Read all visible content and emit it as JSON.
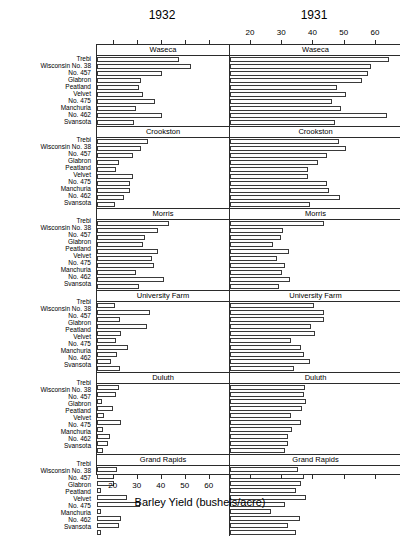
{
  "titles": {
    "left_year": "1932",
    "right_year": "1931",
    "xlabel": "Barley Yield (bushels/acre)"
  },
  "axis": {
    "ticks": [
      20,
      30,
      40,
      50,
      60
    ],
    "tick_labels": [
      "20",
      "30",
      "40",
      "50",
      "60"
    ],
    "min": 13,
    "max": 68,
    "left_labels_shown": false,
    "right_labels_shown": true,
    "bottom_labels_shown": true
  },
  "varieties": [
    "Trebi",
    "Wisconsin No. 38",
    "No. 457",
    "Glabron",
    "Peatland",
    "Velvet",
    "No. 475",
    "Manchuria",
    "No. 462",
    "Svansota"
  ],
  "sites": [
    "Waseca",
    "Crookston",
    "Morris",
    "University Farm",
    "Duluth",
    "Grand Rapids"
  ],
  "chart_data": {
    "type": "bar",
    "xlabel": "Barley Yield (bushels/acre)",
    "ylabel": "",
    "xlim": [
      13,
      68
    ],
    "grid": false,
    "orientation": "horizontal",
    "categories": [
      "Trebi",
      "Wisconsin No. 38",
      "No. 457",
      "Glabron",
      "Peatland",
      "Velvet",
      "No. 475",
      "Manchuria",
      "No. 462",
      "Svansota"
    ],
    "facet_rows": [
      "Waseca",
      "Crookston",
      "Morris",
      "University Farm",
      "Duluth",
      "Grand Rapids"
    ],
    "facet_columns": [
      "1932",
      "1931"
    ],
    "series": [
      {
        "name": "1932",
        "panels": [
          {
            "site": "Waseca",
            "values": [
              47.3,
              52.2,
              39.9,
              31.4,
              30.6,
              32.1,
              37.2,
              29.4,
              40.0,
              28.6
            ]
          },
          {
            "site": "Crookston",
            "values": [
              34.4,
              31.3,
              28.1,
              22.1,
              21.1,
              28.0,
              26.8,
              26.9,
              24.3,
              20.6
            ]
          },
          {
            "site": "Morris",
            "values": [
              42.8,
              38.3,
              33.1,
              32.1,
              38.4,
              35.8,
              36.7,
              29.3,
              41.0,
              30.6
            ]
          },
          {
            "site": "University Farm",
            "values": [
              20.3,
              35.1,
              22.6,
              33.7,
              22.9,
              20.8,
              26.0,
              21.2,
              18.9,
              22.5
            ]
          },
          {
            "site": "Duluth",
            "values": [
              22.0,
              21.1,
              14.9,
              19.5,
              15.8,
              23.2,
              15.4,
              18.4,
              17.6,
              15.4
            ]
          },
          {
            "site": "Grand Rapids",
            "values": [
              21.4,
              20.0,
              19.9,
              14.5,
              25.5,
              31.1,
              14.7,
              22.8,
              22.0,
              14.8
            ]
          }
        ]
      },
      {
        "name": "1931",
        "panels": [
          {
            "site": "Waseca",
            "values": [
              63.8,
              58.1,
              57.0,
              55.2,
              47.3,
              50.2,
              45.7,
              48.6,
              63.1,
              46.7
            ]
          },
          {
            "site": "Crookston",
            "values": [
              47.9,
              50.2,
              43.9,
              41.0,
              37.9,
              37.8,
              44.0,
              44.8,
              48.2,
              38.5
            ]
          },
          {
            "site": "Morris",
            "values": [
              43.1,
              29.8,
              29.3,
              26.8,
              31.8,
              28.1,
              30.5,
              29.5,
              32.1,
              28.8
            ]
          },
          {
            "site": "University Farm",
            "values": [
              39.9,
              43.1,
              43.0,
              38.8,
              40.2,
              32.4,
              35.6,
              36.8,
              38.6,
              33.4
            ]
          },
          {
            "site": "Duluth",
            "values": [
              37.1,
              36.7,
              37.3,
              36.0,
              32.6,
              35.6,
              32.9,
              31.6,
              31.4,
              30.7
            ]
          },
          {
            "site": "Grand Rapids",
            "values": [
              34.6,
              36.6,
              35.8,
              34.2,
              37.4,
              30.5,
              26.1,
              35.5,
              31.5,
              34.2
            ]
          }
        ]
      }
    ]
  }
}
